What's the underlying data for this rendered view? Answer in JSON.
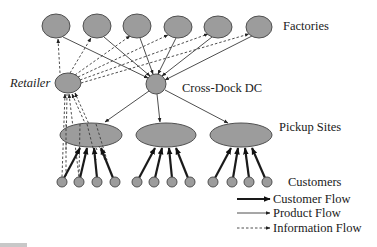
{
  "diagram": {
    "title_labels": {
      "factories": "Factories",
      "retailer": "Retailer",
      "cross_dock": "Cross-Dock DC",
      "pickup_sites": "Pickup Sites",
      "customers": "Customers"
    },
    "legend": [
      {
        "label": "Customer Flow",
        "style": "thick-solid"
      },
      {
        "label": "Product Flow",
        "style": "thin-solid"
      },
      {
        "label": "Information Flow",
        "style": "dashed"
      }
    ],
    "nodes": {
      "factories": [
        {
          "id": "F1",
          "cx": 56,
          "cy": 26,
          "rx": 14,
          "ry": 12
        },
        {
          "id": "F2",
          "cx": 97,
          "cy": 26,
          "rx": 14,
          "ry": 12
        },
        {
          "id": "F3",
          "cx": 137,
          "cy": 26,
          "rx": 14,
          "ry": 12
        },
        {
          "id": "F4",
          "cx": 178,
          "cy": 27,
          "rx": 14,
          "ry": 11
        },
        {
          "id": "F5",
          "cx": 218,
          "cy": 27,
          "rx": 14,
          "ry": 11
        },
        {
          "id": "F6",
          "cx": 259,
          "cy": 27,
          "rx": 13,
          "ry": 11
        }
      ],
      "retailer": {
        "id": "R",
        "cx": 68,
        "cy": 83,
        "rx": 13,
        "ry": 10
      },
      "cross_dock": {
        "id": "DC",
        "cx": 156,
        "cy": 84,
        "rx": 10,
        "ry": 10
      },
      "pickup_sites": [
        {
          "id": "P1",
          "cx": 91,
          "cy": 135,
          "rx": 31,
          "ry": 12
        },
        {
          "id": "P2",
          "cx": 166,
          "cy": 135,
          "rx": 30,
          "ry": 12
        },
        {
          "id": "P3",
          "cx": 241,
          "cy": 135,
          "rx": 31,
          "ry": 12
        }
      ],
      "customers": [
        {
          "id": "C1",
          "cx": 62,
          "cy": 182,
          "site": "P1"
        },
        {
          "id": "C2",
          "cx": 79,
          "cy": 182,
          "site": "P1"
        },
        {
          "id": "C3",
          "cx": 97,
          "cy": 182,
          "site": "P1"
        },
        {
          "id": "C4",
          "cx": 115,
          "cy": 182,
          "site": "P1"
        },
        {
          "id": "C5",
          "cx": 137,
          "cy": 182,
          "site": "P2"
        },
        {
          "id": "C6",
          "cx": 154,
          "cy": 182,
          "site": "P2"
        },
        {
          "id": "C7",
          "cx": 172,
          "cy": 182,
          "site": "P2"
        },
        {
          "id": "C8",
          "cx": 190,
          "cy": 182,
          "site": "P2"
        },
        {
          "id": "C9",
          "cx": 213,
          "cy": 182,
          "site": "P3"
        },
        {
          "id": "C10",
          "cx": 232,
          "cy": 182,
          "site": "P3"
        },
        {
          "id": "C11",
          "cx": 249,
          "cy": 182,
          "site": "P3"
        },
        {
          "id": "C12",
          "cx": 267,
          "cy": 182,
          "site": "P3"
        }
      ]
    },
    "edges": {
      "product_flow": "Factories -> Cross-Dock DC -> Pickup Sites",
      "information_flow": "Customers -> Retailer -> Factories",
      "customer_flow": "Customers -> Pickup Sites"
    }
  }
}
